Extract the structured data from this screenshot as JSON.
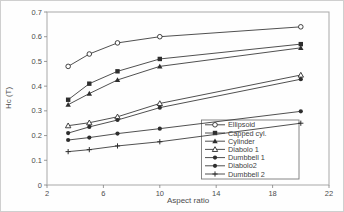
{
  "figure": {
    "background": "#fefefe",
    "outer_border_color": "#cfcfcf",
    "frame_color": "#a8a8a8",
    "tick_color": "#808080",
    "text_color": "#4d4d4d",
    "line_color": "#3c3c3c",
    "marker_color": "#2e2e2e",
    "legend_border_color": "#7a7a7a",
    "legend_background": "#ffffff"
  },
  "chart_data": {
    "type": "line",
    "title": "",
    "xlabel": "Aspect ratio",
    "ylabel": "Hc (T)",
    "xlim": [
      2,
      22
    ],
    "ylim": [
      0,
      0.7
    ],
    "x_ticks": [
      2,
      6,
      10,
      14,
      18,
      22
    ],
    "x_tick_labels": [
      "2",
      "6",
      "10",
      "14",
      "18",
      "22"
    ],
    "y_ticks": [
      0,
      0.1,
      0.2,
      0.3,
      0.4,
      0.5,
      0.6,
      0.7
    ],
    "y_tick_labels": [
      "0",
      "0.1",
      "0.2",
      "0.3",
      "0.4",
      "0.5",
      "0.6",
      "0.7"
    ],
    "grid": false,
    "legend": {
      "position": "inside-lower-right",
      "border": true
    },
    "x": [
      3.5,
      5,
      7,
      10,
      20
    ],
    "series": [
      {
        "name": "Ellipsoid",
        "marker": "circle-open",
        "values": [
          0.48,
          0.53,
          0.575,
          0.6,
          0.64
        ]
      },
      {
        "name": "Capped cyl.",
        "marker": "square-filled",
        "values": [
          0.345,
          0.41,
          0.46,
          0.51,
          0.57
        ]
      },
      {
        "name": "Cylinder",
        "marker": "triangle-filled",
        "values": [
          0.325,
          0.37,
          0.425,
          0.48,
          0.555
        ]
      },
      {
        "name": "Diabolo 1",
        "marker": "triangle-open",
        "values": [
          0.24,
          0.252,
          0.276,
          0.33,
          0.445
        ]
      },
      {
        "name": "Dumbbell 1",
        "marker": "circle-filled",
        "values": [
          0.21,
          0.235,
          0.263,
          0.313,
          0.428
        ]
      },
      {
        "name": "Diabolo2",
        "marker": "circle-filled",
        "values": [
          0.182,
          0.192,
          0.208,
          0.228,
          0.298
        ]
      },
      {
        "name": "Dumbbell 2",
        "marker": "plus",
        "values": [
          0.135,
          0.143,
          0.158,
          0.175,
          0.25
        ]
      }
    ]
  }
}
